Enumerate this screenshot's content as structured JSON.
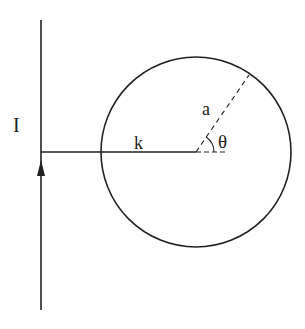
{
  "diagram": {
    "labels": {
      "current": "I",
      "distance": "k",
      "radius": "a",
      "angle": "θ"
    },
    "colors": {
      "stroke": "#222222",
      "background": "#ffffff"
    },
    "elements": {
      "wire": "infinite straight wire carrying current I (upward arrow)",
      "circle": "circle of radius a",
      "perpendicular": "perpendicular distance k from wire to circle center",
      "radius_line": "dashed radius at angle θ from horizontal"
    }
  }
}
